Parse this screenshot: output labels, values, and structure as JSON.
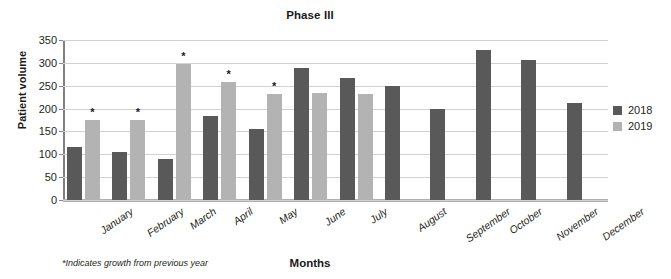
{
  "chart_data": {
    "type": "bar",
    "title": "Phase III",
    "xlabel": "Months",
    "ylabel": "Patient volume",
    "ylim": [
      0,
      350
    ],
    "ytick_step": 50,
    "yticks": [
      0,
      50,
      100,
      150,
      200,
      250,
      300,
      350
    ],
    "grid": true,
    "legend_position": "right",
    "footnote": "*Indicates growth from previous year",
    "categories": [
      "January",
      "February",
      "March",
      "April",
      "May",
      "June",
      "July",
      "August",
      "September",
      "October",
      "November",
      "December"
    ],
    "series": [
      {
        "name": "2018",
        "color": "#595959",
        "values": [
          117,
          105,
          89,
          183,
          156,
          289,
          268,
          250,
          200,
          328,
          307,
          213
        ]
      },
      {
        "name": "2019",
        "color": "#b3b3b3",
        "values": [
          176,
          174,
          298,
          258,
          231,
          234,
          231,
          null,
          null,
          null,
          null,
          null
        ]
      }
    ],
    "annotations": {
      "symbol": "*",
      "series": "2019",
      "categories": [
        "January",
        "February",
        "March",
        "April",
        "May"
      ]
    }
  },
  "colors": {
    "series_2018": "#595959",
    "series_2019": "#b3b3b3",
    "gridline": "#d2d2d2",
    "axis": "#808080",
    "text": "#231f20",
    "background": "#ffffff"
  }
}
